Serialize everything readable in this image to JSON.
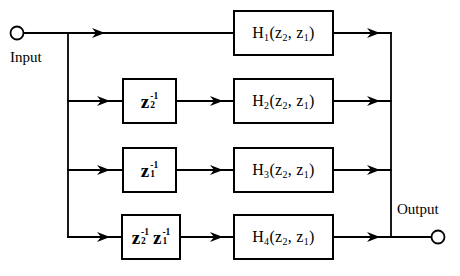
{
  "colors": {
    "line": "#000000",
    "background": "#ffffff"
  },
  "diagram": {
    "input_label": "Input",
    "output_label": "Output",
    "delay_boxes": [
      {
        "terms": [
          {
            "base": "z",
            "sup": "-1",
            "sub": "2"
          }
        ]
      },
      {
        "terms": [
          {
            "base": "z",
            "sup": "-1",
            "sub": "1"
          }
        ]
      },
      {
        "terms": [
          {
            "base": "z",
            "sup": "-1",
            "sub": "2"
          },
          {
            "base": "z",
            "sup": "-1",
            "sub": "1"
          }
        ]
      }
    ],
    "filter_boxes": [
      {
        "fn": "H",
        "fn_sub": "1",
        "arg_open": "(z",
        "arg1_sub": "2",
        "arg_mid": ", z",
        "arg2_sub": "1",
        "arg_close": ")"
      },
      {
        "fn": "H",
        "fn_sub": "2",
        "arg_open": "(z",
        "arg1_sub": "2",
        "arg_mid": ", z",
        "arg2_sub": "1",
        "arg_close": ")"
      },
      {
        "fn": "H",
        "fn_sub": "3",
        "arg_open": "(z",
        "arg1_sub": "2",
        "arg_mid": ", z",
        "arg2_sub": "1",
        "arg_close": ")"
      },
      {
        "fn": "H",
        "fn_sub": "4",
        "arg_open": "(z",
        "arg1_sub": "2",
        "arg_mid": ", z",
        "arg2_sub": "1",
        "arg_close": ")"
      }
    ]
  }
}
